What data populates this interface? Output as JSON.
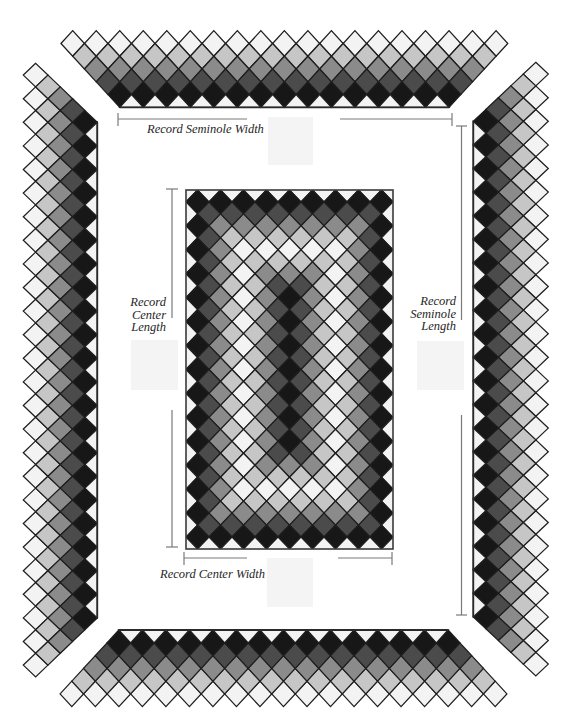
{
  "labels": {
    "seminole_width": "Record Seminole Width",
    "seminole_length": [
      "Record",
      "Seminole",
      "Length"
    ],
    "center_length": [
      "Record",
      "Center",
      "Length"
    ],
    "center_width": "Record Center Width"
  },
  "palette": {
    "white": "#f3f3f3",
    "light": "#c6c6c6",
    "medium": "#8b8b8b",
    "dark": "#4b4b4b",
    "black": "#171717",
    "outline": "#1e1e1e",
    "measure_line": "#7a7a7a",
    "placeholder": "#f4f4f4"
  },
  "center_panel": {
    "diamonds_across": 9,
    "diamonds_down": 15,
    "ring_colors": [
      "white",
      "black",
      "dark",
      "medium",
      "light",
      "white",
      "light",
      "medium",
      "dark",
      "black"
    ]
  },
  "seminole_strips": [
    {
      "id": "top",
      "outer_row_count": 19,
      "row_colors": [
        "white",
        "light",
        "medium",
        "dark",
        "black"
      ],
      "edge_triangle_color": "white"
    },
    {
      "id": "bottom",
      "outer_row_count": 19,
      "row_colors": [
        "white",
        "light",
        "medium",
        "dark",
        "black"
      ],
      "edge_triangle_color": "white"
    },
    {
      "id": "left",
      "outer_row_count": 26,
      "row_colors": [
        "white",
        "light",
        "medium",
        "dark",
        "black"
      ],
      "edge_triangle_color": "white"
    },
    {
      "id": "right",
      "outer_row_count": 26,
      "row_colors": [
        "white",
        "light",
        "medium",
        "dark",
        "black"
      ],
      "edge_triangle_color": "white"
    }
  ]
}
